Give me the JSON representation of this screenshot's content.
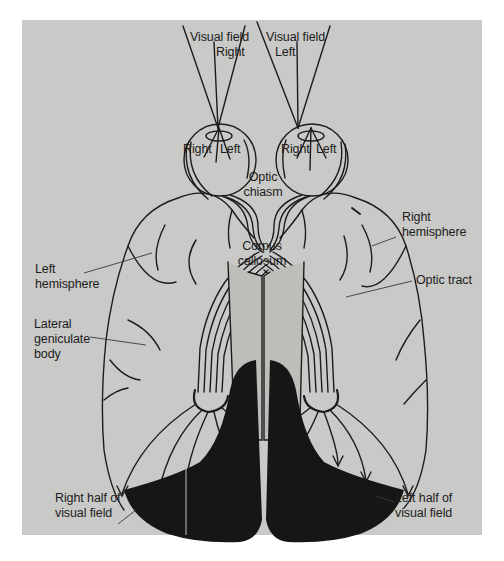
{
  "diagram": {
    "colors": {
      "panel": "#c9c9c7",
      "ink": "#1c1c1c",
      "visual_cortex_fill": "#161616",
      "corpus_callosum": "#bdbdba"
    },
    "labels": {
      "visual_field_right": {
        "line1": "Visual field",
        "line2": "Right"
      },
      "visual_field_left": {
        "line1": "Visual field",
        "line2": "Left"
      },
      "left_eye_retina": {
        "right": "Right",
        "left": "Left"
      },
      "right_eye_retina": {
        "right": "Right",
        "left": "Left"
      },
      "optic_chiasm": {
        "line1": "Optic",
        "line2": "chiasm"
      },
      "corpus_callosum": {
        "line1": "Corpus",
        "line2": "callosum"
      },
      "left_hemisphere": {
        "line1": "Left",
        "line2": "hemisphere"
      },
      "right_hemisphere": {
        "line1": "Right",
        "line2": "hemisphere"
      },
      "optic_tract": "Optic tract",
      "lateral_geniculate_body": {
        "line1": "Lateral",
        "line2": "geniculate",
        "line3": "body"
      },
      "right_half_visual_field": {
        "line1": "Right half of",
        "line2": "visual field"
      },
      "left_half_visual_field": {
        "line1": "Left half of",
        "line2": "visual field"
      }
    }
  }
}
